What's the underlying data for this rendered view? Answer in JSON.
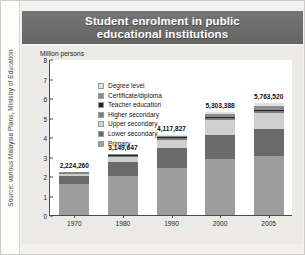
{
  "figure": {
    "title_line1": "Student enrolment in public",
    "title_line2": "educational institutions",
    "source": "Source: various Malaysia Plans, Ministry of Education",
    "title_bg": "#6d6d6d",
    "panel_bg": "#eceae6"
  },
  "chart_data": {
    "type": "bar",
    "stacked": true,
    "title": "Student enrolment in public educational institutions",
    "xlabel": "",
    "ylabel": "Million persons",
    "ylim": [
      0,
      8
    ],
    "yticks": [
      "0",
      "1",
      "2",
      "3",
      "4",
      "5",
      "6",
      "7",
      "8"
    ],
    "categories": [
      "1970",
      "1980",
      "1990",
      "2000",
      "2005"
    ],
    "grid": false,
    "legend_position": "inside-top-left",
    "bar_labels": [
      "2,224,260",
      "3,149,647",
      "4,117,827",
      "5,303,388",
      "5,763,520"
    ],
    "totals": [
      2.22426,
      3.149647,
      4.117827,
      5.303388,
      5.76352
    ],
    "series": [
      {
        "name": "Primary",
        "color": "#9d9d9d",
        "values": [
          1.62,
          2.0,
          2.42,
          2.87,
          3.05
        ]
      },
      {
        "name": "Lower secondary",
        "color": "#6a6a6a",
        "values": [
          0.38,
          0.7,
          1.0,
          1.25,
          1.35
        ]
      },
      {
        "name": "Upper secondary",
        "color": "#cfcfcf",
        "values": [
          0.12,
          0.27,
          0.45,
          0.74,
          0.81
        ]
      },
      {
        "name": "Higher secondary",
        "color": "#7c7c7c",
        "values": [
          0.04,
          0.06,
          0.08,
          0.11,
          0.12
        ]
      },
      {
        "name": "Teacher education",
        "color": "#232323",
        "values": [
          0.03,
          0.04,
          0.05,
          0.07,
          0.08
        ]
      },
      {
        "name": "Certificate/diploma",
        "color": "#8c8c8c",
        "values": [
          0.03,
          0.05,
          0.07,
          0.13,
          0.18
        ]
      },
      {
        "name": "Degree level",
        "color": "#e2e2e2",
        "values": [
          0.02,
          0.03,
          0.04,
          0.13,
          0.17
        ]
      }
    ]
  },
  "legend": {
    "items": [
      {
        "label": "Degree level",
        "color": "#e2e2e2"
      },
      {
        "label": "Certificate/diploma",
        "color": "#8c8c8c"
      },
      {
        "label": "Teacher education",
        "color": "#232323"
      },
      {
        "label": "Higher secondary",
        "color": "#7c7c7c"
      },
      {
        "label": "Upper secondary",
        "color": "#cfcfcf"
      },
      {
        "label": "Lower secondary",
        "color": "#6a6a6a"
      },
      {
        "label": "Primary",
        "color": "#9d9d9d"
      }
    ]
  }
}
